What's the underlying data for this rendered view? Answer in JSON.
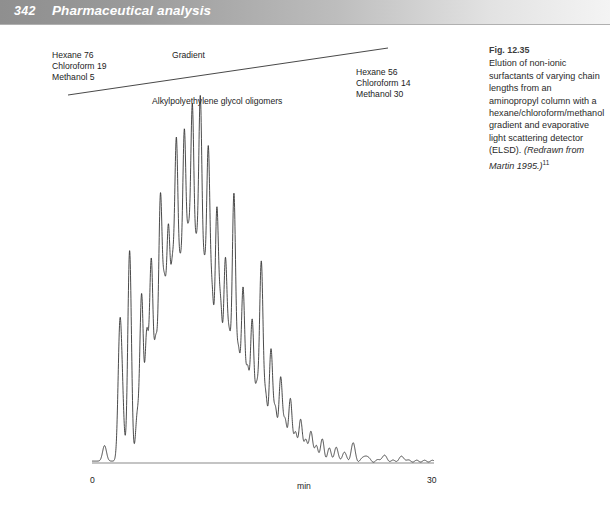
{
  "header": {
    "page_number": "342",
    "chapter_title": "Pharmaceutical analysis",
    "band_color_left": "#8f8f8f",
    "band_color_right": "#f4f4f4",
    "text_color": "#ffffff"
  },
  "figure": {
    "gradient_label": "Gradient",
    "plot_title": "Alkylpolyethylene glycol oligomers",
    "solvent_start": "Hexane 76\nChloroform 19\nMethanol 5",
    "solvent_end": "Hexane 56\nChloroform 14\nMethanol 30",
    "line_color": "#333333"
  },
  "caption": {
    "number": "Fig. 12.35",
    "text_main": "Elution of non-ionic surfactants of varying chain lengths from an aminopropyl column with a hexane/chloroform/methanol gradient and evaporative light scattering detector (ELSD). ",
    "source": "(Redrawn from Martin 1995.)",
    "reference_marker": "11"
  },
  "chart_data": {
    "type": "line",
    "title": "Alkylpolyethylene glycol oligomers",
    "subtitle": "Elution of non-ionic surfactants from an aminopropyl column (ELSD detector)",
    "xlabel": "min",
    "ylabel": "",
    "xlim": [
      0,
      30
    ],
    "ylim": [
      0,
      100
    ],
    "grid": false,
    "legend": null,
    "xticks": [
      0,
      30
    ],
    "xticklabels": [
      "0",
      "30"
    ],
    "annotations": [
      {
        "text": "Gradient",
        "x": 10.5,
        "y": 104
      },
      {
        "text": "Hexane 76 / Chloroform 19 / Methanol 5",
        "x": 0.5,
        "y": 104
      },
      {
        "text": "Hexane 56 / Chloroform 14 / Methanol 30",
        "x": 23.5,
        "y": 96
      }
    ],
    "gradient_line": {
      "x": [
        0.0,
        30.0
      ],
      "y": [
        76,
        56
      ],
      "label": "Gradient",
      "description": "Linear solvent gradient overlay drawn above the chromatogram"
    },
    "series": [
      {
        "name": "ELSD response",
        "description": "Chromatographic peak train: retention time (min) and relative peak height (% of full scale)",
        "peaks": [
          {
            "rt": 1.1,
            "height": 4.5,
            "width": 0.17
          },
          {
            "rt": 2.45,
            "height": 39.0,
            "width": 0.16
          },
          {
            "rt": 2.7,
            "height": 11.5,
            "width": 0.14
          },
          {
            "rt": 3.3,
            "height": 61.0,
            "width": 0.16
          },
          {
            "rt": 3.95,
            "height": 12.0,
            "width": 0.14
          },
          {
            "rt": 4.35,
            "height": 48.0,
            "width": 0.16
          },
          {
            "rt": 4.8,
            "height": 35.0,
            "width": 0.15
          },
          {
            "rt": 5.2,
            "height": 57.0,
            "width": 0.16
          },
          {
            "rt": 5.6,
            "height": 31.0,
            "width": 0.15
          },
          {
            "rt": 6.0,
            "height": 74.0,
            "width": 0.16
          },
          {
            "rt": 6.35,
            "height": 42.0,
            "width": 0.15
          },
          {
            "rt": 6.7,
            "height": 63.0,
            "width": 0.16
          },
          {
            "rt": 7.05,
            "height": 46.0,
            "width": 0.15
          },
          {
            "rt": 7.4,
            "height": 88.0,
            "width": 0.16
          },
          {
            "rt": 7.75,
            "height": 44.0,
            "width": 0.15
          },
          {
            "rt": 8.1,
            "height": 90.0,
            "width": 0.16
          },
          {
            "rt": 8.45,
            "height": 52.0,
            "width": 0.15
          },
          {
            "rt": 8.8,
            "height": 97.0,
            "width": 0.16
          },
          {
            "rt": 9.15,
            "height": 48.0,
            "width": 0.15
          },
          {
            "rt": 9.5,
            "height": 100.0,
            "width": 0.16
          },
          {
            "rt": 9.85,
            "height": 43.0,
            "width": 0.15
          },
          {
            "rt": 10.2,
            "height": 86.0,
            "width": 0.16
          },
          {
            "rt": 10.55,
            "height": 40.0,
            "width": 0.15
          },
          {
            "rt": 10.95,
            "height": 70.0,
            "width": 0.16
          },
          {
            "rt": 11.3,
            "height": 38.0,
            "width": 0.15
          },
          {
            "rt": 11.7,
            "height": 56.0,
            "width": 0.16
          },
          {
            "rt": 12.05,
            "height": 30.0,
            "width": 0.15
          },
          {
            "rt": 12.45,
            "height": 76.0,
            "width": 0.16
          },
          {
            "rt": 12.85,
            "height": 28.0,
            "width": 0.15
          },
          {
            "rt": 13.25,
            "height": 49.0,
            "width": 0.16
          },
          {
            "rt": 13.65,
            "height": 24.0,
            "width": 0.15
          },
          {
            "rt": 14.05,
            "height": 40.0,
            "width": 0.16
          },
          {
            "rt": 14.45,
            "height": 19.0,
            "width": 0.15
          },
          {
            "rt": 14.85,
            "height": 57.0,
            "width": 0.16
          },
          {
            "rt": 15.25,
            "height": 17.0,
            "width": 0.15
          },
          {
            "rt": 15.7,
            "height": 32.0,
            "width": 0.16
          },
          {
            "rt": 16.1,
            "height": 14.0,
            "width": 0.15
          },
          {
            "rt": 16.55,
            "height": 24.0,
            "width": 0.16
          },
          {
            "rt": 16.95,
            "height": 11.0,
            "width": 0.15
          },
          {
            "rt": 17.4,
            "height": 18.0,
            "width": 0.16
          },
          {
            "rt": 17.85,
            "height": 8.0,
            "width": 0.15
          },
          {
            "rt": 18.3,
            "height": 12.0,
            "width": 0.16
          },
          {
            "rt": 18.75,
            "height": 6.0,
            "width": 0.15
          },
          {
            "rt": 19.2,
            "height": 9.0,
            "width": 0.16
          },
          {
            "rt": 19.7,
            "height": 4.5,
            "width": 0.15
          },
          {
            "rt": 20.2,
            "height": 6.0,
            "width": 0.16
          },
          {
            "rt": 20.8,
            "height": 3.5,
            "width": 0.16
          },
          {
            "rt": 21.4,
            "height": 4.0,
            "width": 0.16
          },
          {
            "rt": 22.1,
            "height": 2.5,
            "width": 0.18
          },
          {
            "rt": 22.9,
            "height": 5.0,
            "width": 0.18
          },
          {
            "rt": 24.0,
            "height": 1.8,
            "width": 0.22
          },
          {
            "rt": 25.6,
            "height": 1.5,
            "width": 0.25
          },
          {
            "rt": 27.2,
            "height": 1.2,
            "width": 0.25
          }
        ]
      }
    ]
  }
}
